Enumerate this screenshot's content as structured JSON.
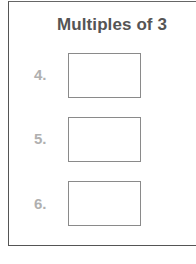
{
  "worksheet": {
    "title": "Multiples of 3",
    "rows": [
      {
        "number": "4.",
        "answer": ""
      },
      {
        "number": "5.",
        "answer": ""
      },
      {
        "number": "6.",
        "answer": ""
      }
    ]
  },
  "colors": {
    "title": "#555555",
    "number": "#b0b0b0",
    "box_border": "#8a8a8a",
    "frame_border": "#555555"
  }
}
